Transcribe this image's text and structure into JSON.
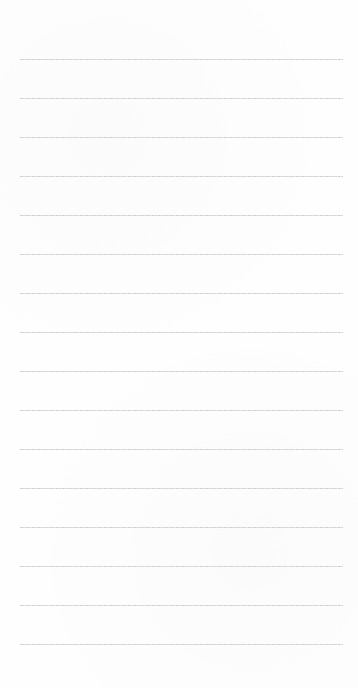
{
  "page": {
    "type": "lined-paper",
    "line_count": 16,
    "line_color": "#cfcfcf",
    "background_color": "#fefefe"
  }
}
